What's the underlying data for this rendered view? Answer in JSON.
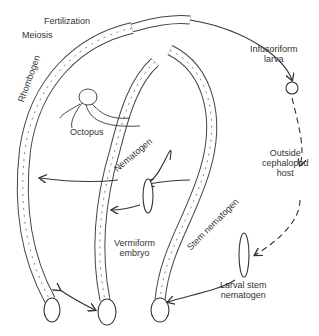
{
  "diagram": {
    "labels": {
      "fertilization": "Fertilization",
      "meiosis": "Meiosis",
      "rhombogen": "Rhombogen",
      "octopus": "Octopus",
      "nematogen": "Nematogen",
      "infusoriform_1": "Infusoriform",
      "infusoriform_2": "larva",
      "outside_1": "Outside",
      "outside_2": "cephalopod",
      "outside_3": "host",
      "stem_nematogen": "Stem nematogen",
      "vermiform_1": "Vermiform",
      "vermiform_2": "embryo",
      "larval_1": "Larval stem",
      "larval_2": "nematogen"
    },
    "colors": {
      "line": "#333333",
      "fill": "#ffffff",
      "cells": "#777777"
    }
  }
}
